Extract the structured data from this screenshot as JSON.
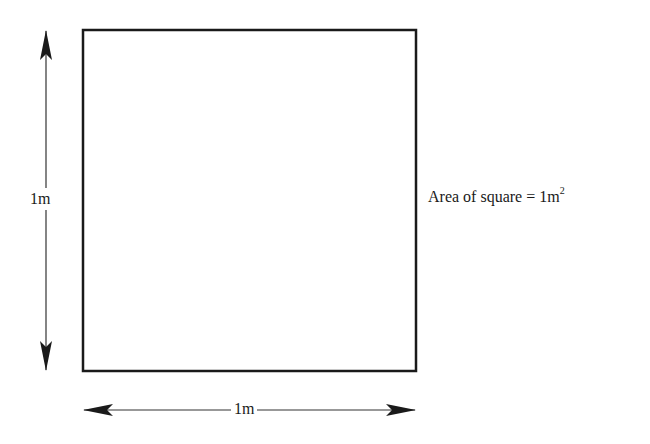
{
  "diagram": {
    "type": "labeled-square",
    "square": {
      "x": 83,
      "y": 30,
      "width": 333,
      "height": 341,
      "stroke": "#1a1a1a",
      "stroke_width": 2.5
    },
    "vertical_arrow": {
      "x": 46,
      "y1": 30,
      "y2": 371,
      "label": "1m"
    },
    "horizontal_arrow": {
      "y": 410,
      "x1": 83,
      "x2": 416,
      "label": "1m"
    },
    "area_caption": {
      "prefix": "Area of square = 1m",
      "superscript": "2"
    }
  }
}
